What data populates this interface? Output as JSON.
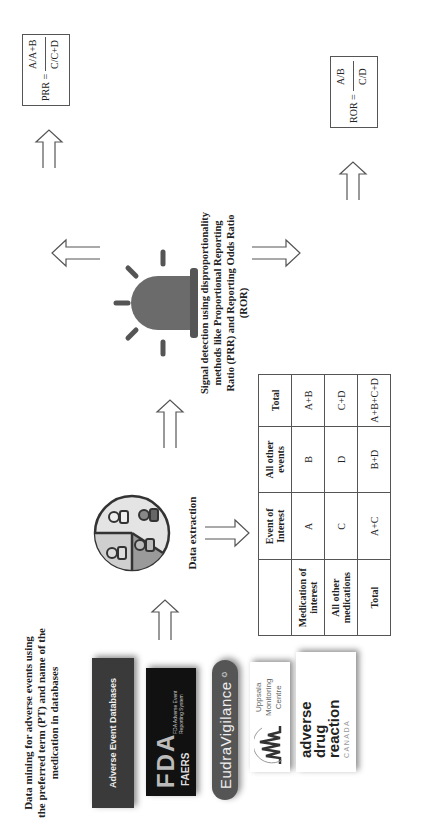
{
  "step1": {
    "title": "Data mining for adverse events using the preferred term (PT) and name of the medication in databases",
    "databases": [
      {
        "name": "Adverse Event Databases",
        "bg": "#3a3a3a"
      },
      {
        "name": "FDA FAERS",
        "line1": "FDA",
        "line2": "FAERS",
        "sub": "FDA Adverse Event Reporting System",
        "bg": "#111111"
      },
      {
        "name": "EudraVigilance",
        "bg": "#555555"
      },
      {
        "name": "Uppsala Monitoring Centre",
        "line1": "Uppsala",
        "line2": "Monitoring",
        "line3": "Centre"
      },
      {
        "name": "adverse drug reaction CANADA",
        "line1": "adverse",
        "line2": "drug",
        "line3": "reaction",
        "line4": "CANADA"
      }
    ]
  },
  "step2": {
    "label": "Data extraction",
    "icon": "database-people-icon",
    "table": {
      "headers": [
        "",
        "Event of Interest",
        "All other events",
        "Total"
      ],
      "rows": [
        [
          "Medication of interest",
          "A",
          "B",
          "A+B"
        ],
        [
          "All other medications",
          "C",
          "D",
          "C+D"
        ],
        [
          "Total",
          "A+C",
          "B+D",
          "A+B+C+D"
        ]
      ]
    }
  },
  "step3": {
    "label": "Signal detection using disproportionality methods like Proportional Reporting Ratio (PRR) and Reporting Odds Ratio (ROR)",
    "icon": "alarm-siren-icon",
    "prr_formula": {
      "lhs": "PRR =",
      "numerator": "A/A+B",
      "denominator": "C/C+D"
    },
    "ror_formula": {
      "lhs": "ROR =",
      "numerator": "A/B",
      "denominator": "C/D"
    }
  },
  "prr_criteria": {
    "intro": "A signal is identified if,",
    "a_heading": "a) When the PRR is displayed with its 95% confidence interval:",
    "a_items": [
      "• The lower bound of the 95% confidence interval greater or equal to 1",
      "• The number of individual cases (A) greater or equal to 3"
    ],
    "b_heading": "b) When the PRR is displayed with the χ2 statistic:",
    "b_items": [
      "•The PRR ≥ 2",
      "•The χ2 ≥ 4",
      "•The number of individual cases (A) greater or equal to 3"
    ]
  },
  "ror_criteria": {
    "intro": "A signal is identified if,",
    "text": "The lower bound of the 95% confidence interval of ROR is greater or equal to 1"
  },
  "colors": {
    "siren": "#6b6b6b",
    "pie_dark": "#9a9a9a",
    "pie_light": "#cfcfcf",
    "pie_lighter": "#e4e4e4",
    "border": "#555555"
  }
}
